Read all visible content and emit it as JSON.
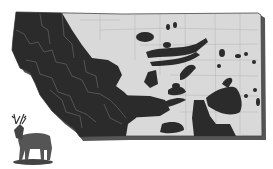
{
  "map": {
    "subject": "Montana state map with shaded range distribution",
    "colors": {
      "background": "#ffffff",
      "state_fill": "#d9d9d9",
      "range_fill": "#2b2b2b",
      "county_lines": "#8a8a8a",
      "shadow": "#555555"
    },
    "legend": [],
    "illustration": "deer-icon"
  }
}
